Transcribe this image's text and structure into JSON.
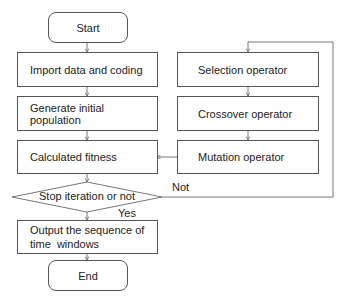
{
  "flowchart": {
    "start": "Start",
    "import": "Import data and coding",
    "generate": "Generate initial population",
    "fitness": "Calculated fitness",
    "decision": "Stop iteration or not",
    "output_line1": "Output the sequence of",
    "output_line2": "time  windows",
    "end": "End",
    "selection": "Selection operator",
    "crossover": "Crossover operator",
    "mutation": "Mutation operator",
    "yes_label": "Yes",
    "no_label": "Not"
  },
  "colors": {
    "stroke": "#555555",
    "text": "#222222",
    "background": "#ffffff"
  }
}
